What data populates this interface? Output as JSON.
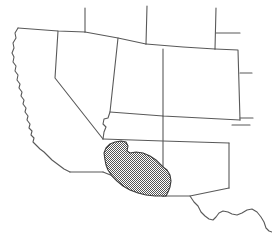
{
  "figure": {
    "width": 272,
    "height": 245,
    "background_color": "#ffffff",
    "line_color": "#595959",
    "shaded_fill_color": "#808080",
    "shaded_outline_color": "#3a3a3a",
    "shaded_fill_pattern": "checkerboard-dither"
  },
  "map_data": {
    "type": "outline-map",
    "projection_hint": "plate-carree",
    "regions": [
      {
        "name": "california",
        "label": "California",
        "shaded": false
      },
      {
        "name": "nevada",
        "label": "Nevada",
        "shaded": false
      },
      {
        "name": "oregon",
        "label": "Oregon",
        "shaded": false
      },
      {
        "name": "idaho",
        "label": "Idaho",
        "shaded": false
      },
      {
        "name": "utah",
        "label": "Utah",
        "shaded": false
      },
      {
        "name": "arizona",
        "label": "Arizona",
        "shaded": true
      },
      {
        "name": "wyoming",
        "label": "Wyoming",
        "shaded": false
      },
      {
        "name": "colorado",
        "label": "Colorado",
        "shaded": false
      },
      {
        "name": "new-mexico",
        "label": "New Mexico",
        "shaded": true
      },
      {
        "name": "texas",
        "label": "Texas",
        "shaded": false
      }
    ],
    "shaded_area": {
      "name": "distribution-range",
      "label": "Shaded distribution range",
      "covers": [
        "southern Arizona",
        "southeastern California",
        "extreme southwestern New Mexico"
      ],
      "fill": "#808080",
      "outline": "#3a3a3a",
      "approx_extent_px": {
        "left": 103,
        "top": 141,
        "right": 172,
        "bottom": 196
      }
    },
    "features": [
      {
        "name": "pacific-coastline",
        "label": "Pacific coastline",
        "type": "coast"
      },
      {
        "name": "rio-grande",
        "label": "Rio Grande",
        "type": "river-border"
      },
      {
        "name": "colorado-river-border",
        "label": "Colorado River border",
        "type": "river-border"
      },
      {
        "name": "mexico-border",
        "label": "United States - Mexico border",
        "type": "international-border"
      }
    ]
  }
}
